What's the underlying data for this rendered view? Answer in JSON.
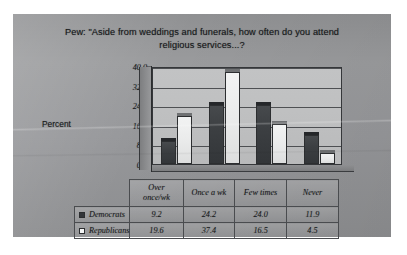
{
  "chart_data": {
    "type": "bar",
    "title": "Pew: \"Aside from weddings and funerals, how often do you attend religious services...?",
    "title_line1": "Pew: \"Aside from weddings and funerals, how often do you attend",
    "title_line2": "religious services...?",
    "xlabel": "",
    "ylabel": "Percent",
    "ylim": [
      0,
      40
    ],
    "ytick_labels": [
      "40.0",
      "32.0",
      "24.0",
      "16.0",
      "8.0",
      "0.0"
    ],
    "ytick_values": [
      40.0,
      32.0,
      24.0,
      16.0,
      8.0,
      0.0
    ],
    "grid": true,
    "legend_position": "data-table",
    "categories": [
      "Over once/wk",
      "Once a wk",
      "Few times",
      "Never"
    ],
    "category_lines": [
      [
        "Over",
        "once/wk"
      ],
      [
        "Once a wk"
      ],
      [
        "Few times"
      ],
      [
        "Never"
      ]
    ],
    "series": [
      {
        "name": "Democrats",
        "marker": "filled-square",
        "color": "#33363a",
        "values": [
          9.2,
          24.2,
          24.0,
          11.9
        ]
      },
      {
        "name": "Republicans",
        "marker": "empty-square",
        "color": "#f4f5f5",
        "values": [
          19.6,
          37.4,
          16.5,
          4.5
        ]
      }
    ]
  },
  "table": {
    "row_labels": [
      "Democrats",
      "Republicans"
    ],
    "rows": [
      [
        "9.2",
        "24.2",
        "24.0",
        "11.9"
      ],
      [
        "19.6",
        "37.4",
        "16.5",
        "4.5"
      ]
    ]
  }
}
